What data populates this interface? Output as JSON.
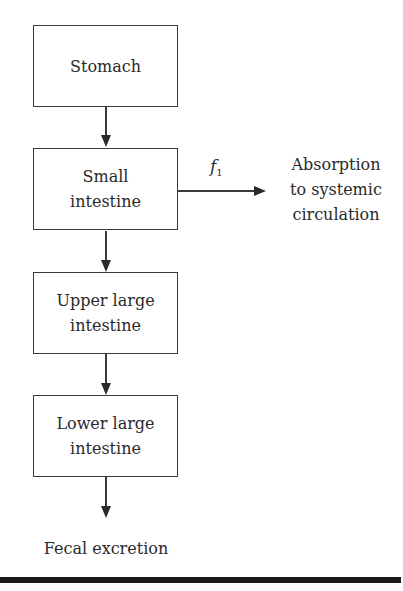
{
  "diagram": {
    "type": "flowchart",
    "boxes": [
      {
        "id": "stomach",
        "label": "Stomach"
      },
      {
        "id": "small-intestine",
        "label_line1": "Small",
        "label_line2": "intestine"
      },
      {
        "id": "upper-large-intestine",
        "label_line1": "Upper large",
        "label_line2": "intestine"
      },
      {
        "id": "lower-large-intestine",
        "label_line1": "Lower large",
        "label_line2": "intestine"
      }
    ],
    "side_branch": {
      "from": "small-intestine",
      "parameter": "f",
      "parameter_subscript": "1",
      "target_line1": "Absorption",
      "target_line2": "to systemic",
      "target_line3": "circulation"
    },
    "terminal": {
      "label": "Fecal excretion"
    },
    "edges": [
      [
        "stomach",
        "small-intestine"
      ],
      [
        "small-intestine",
        "upper-large-intestine"
      ],
      [
        "upper-large-intestine",
        "lower-large-intestine"
      ],
      [
        "lower-large-intestine",
        "fecal-excretion"
      ],
      [
        "small-intestine",
        "absorption-to-systemic-circulation"
      ]
    ]
  }
}
